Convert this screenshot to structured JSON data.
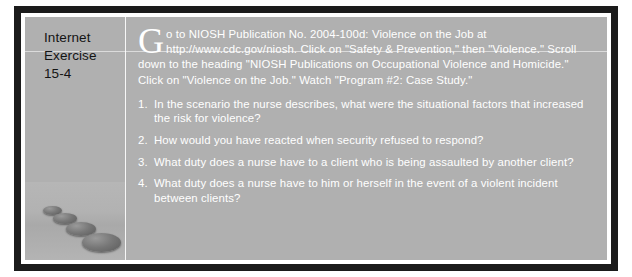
{
  "exercise": {
    "label_line1": "Internet",
    "label_line2": "Exercise",
    "label_line3": "15-4",
    "dropcap": "G",
    "intro": "o to NIOSH Publication No. 2004-100d: Violence on the Job at http://www.cdc.gov/niosh. Click on \"Safety & Prevention,\" then \"Violence.\" Scroll down to the heading \"NIOSH Publications on Occupational Violence and Homicide.\" Click on \"Violence on the Job.\" Watch \"Program #2: Case Study.\"",
    "questions": [
      {
        "number": "1.",
        "text": "In the scenario the nurse describes, what were the situational factors that increased the risk for violence?"
      },
      {
        "number": "2.",
        "text": "How would you have reacted when security refused to respond?"
      },
      {
        "number": "3.",
        "text": "What duty does a nurse have to a client who is being assaulted by another client?"
      },
      {
        "number": "4.",
        "text": "What duty does a nurse have to him or herself in the event of a violent incident between clients?"
      }
    ],
    "image_caption": "stepping stones"
  },
  "colors": {
    "frame": "#1b1b1b",
    "panel": "#b0b0b0",
    "text_light": "#ffffff",
    "text_dark": "#141414"
  }
}
